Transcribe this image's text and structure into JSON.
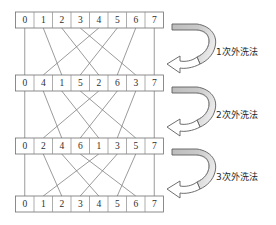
{
  "figure": {
    "type": "perfect-shuffle-network-diagram",
    "background_color": "#ffffff",
    "line_color": "#7a7a7a",
    "box_stroke_color": "#6f6f6f",
    "arrow_band_fill": "#b9b9b9",
    "arrow_head_fill": "#ffffff",
    "text_color": "#2b2b2b"
  },
  "rows": [
    {
      "name": "row-initial",
      "cells": [
        "0",
        "1",
        "2",
        "3",
        "4",
        "5",
        "6",
        "7"
      ]
    },
    {
      "name": "row-after-pass-1",
      "cells": [
        "0",
        "4",
        "1",
        "5",
        "2",
        "6",
        "3",
        "7"
      ]
    },
    {
      "name": "row-after-pass-2",
      "cells": [
        "0",
        "2",
        "4",
        "6",
        "1",
        "3",
        "5",
        "7"
      ]
    },
    {
      "name": "row-after-pass-3",
      "cells": [
        "0",
        "1",
        "2",
        "3",
        "4",
        "5",
        "6",
        "7"
      ]
    }
  ],
  "mappings": [
    {
      "name": "pass-1",
      "targets": [
        0,
        2,
        4,
        6,
        1,
        3,
        5,
        7
      ]
    },
    {
      "name": "pass-2",
      "targets": [
        0,
        2,
        4,
        6,
        1,
        3,
        5,
        7
      ]
    },
    {
      "name": "pass-3",
      "targets": [
        0,
        2,
        4,
        6,
        1,
        3,
        5,
        7
      ]
    }
  ],
  "arrows": [
    {
      "name": "arrow-pass-1",
      "label": "1次外洗法"
    },
    {
      "name": "arrow-pass-2",
      "label": "2次外洗法"
    },
    {
      "name": "arrow-pass-3",
      "label": "3次外洗法"
    }
  ]
}
